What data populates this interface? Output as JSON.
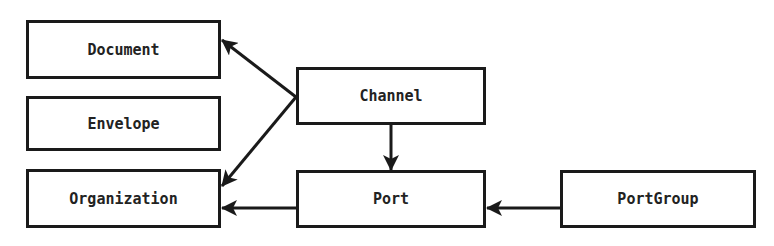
{
  "diagram": {
    "nodes": [
      {
        "id": "document",
        "label": "Document"
      },
      {
        "id": "envelope",
        "label": "Envelope"
      },
      {
        "id": "organization",
        "label": "Organization"
      },
      {
        "id": "channel",
        "label": "Channel"
      },
      {
        "id": "port",
        "label": "Port"
      },
      {
        "id": "portgroup",
        "label": "PortGroup"
      }
    ],
    "edges": [
      {
        "from": "channel",
        "to": "document"
      },
      {
        "from": "channel",
        "to": "organization"
      },
      {
        "from": "channel",
        "to": "port"
      },
      {
        "from": "port",
        "to": "organization"
      },
      {
        "from": "portgroup",
        "to": "port"
      }
    ],
    "colors": {
      "stroke": "#1a1a1a",
      "background": "#ffffff",
      "text": "#222222"
    }
  }
}
